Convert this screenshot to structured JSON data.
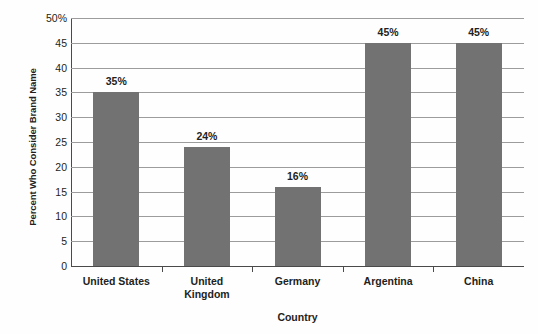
{
  "chart_data": {
    "type": "bar",
    "title": "",
    "subtitle": "",
    "xlabel": "Country",
    "ylabel": "Percent Who Consider Brand Name",
    "categories": [
      "United States",
      "United Kingdom",
      "Germany",
      "Argentina",
      "China"
    ],
    "values": [
      35,
      24,
      16,
      45,
      45
    ],
    "data_labels": [
      "35%",
      "24%",
      "16%",
      "45%",
      "45%"
    ],
    "ylim": [
      0,
      50
    ],
    "ytick_values": [
      0,
      5,
      10,
      15,
      20,
      25,
      30,
      35,
      40,
      45,
      50
    ],
    "ytick_labels": [
      "0",
      "5",
      "10",
      "15",
      "20",
      "25",
      "30",
      "35",
      "40",
      "45",
      "50%"
    ],
    "grid": true,
    "grid_axis": "y",
    "legend": false,
    "legend_position": "none",
    "bar_color": "#727272",
    "gridline_color": "#9c9c9c",
    "axis_color": "#4a4a4a",
    "background_color": "#fefefe",
    "text_color": "#231f20"
  }
}
